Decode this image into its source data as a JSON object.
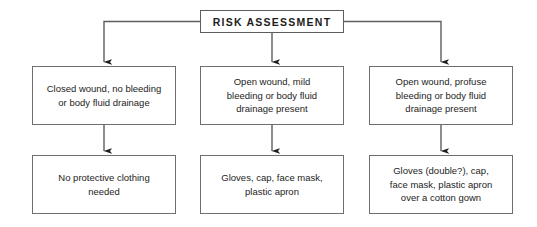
{
  "figure": {
    "line_color": "#5d5d5d",
    "arrow_color": "#1d1d1b",
    "box_border_color": "#6e6e6e",
    "text_color": "#1d1d1b",
    "background": "#ffffff"
  },
  "root": {
    "label": "RISK ASSESSMENT"
  },
  "branches": [
    {
      "id": "left",
      "condition": "Closed wound, no bleeding\nor body fluid drainage",
      "action": "No protective clothing\nneeded"
    },
    {
      "id": "center",
      "condition": "Open wound, mild\nbleeding or body fluid\ndrainage present",
      "action": "Gloves, cap, face mask,\nplastic apron"
    },
    {
      "id": "right",
      "condition": "Open wound, profuse\nbleeding or body fluid\ndrainage present",
      "action": "Gloves (double?), cap,\nface mask, plastic apron\nover a cotton gown"
    }
  ]
}
